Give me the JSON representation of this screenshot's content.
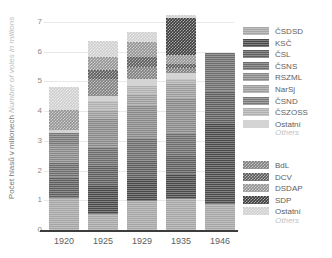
{
  "chart_data": {
    "type": "bar",
    "stacked": true,
    "title": "",
    "xlabel": "",
    "ylabel": "Počet hlasů v milionech",
    "ylabel_en": "Number of votes in millions",
    "ylim": [
      0,
      7
    ],
    "yticks": [
      0,
      1,
      2,
      3,
      4,
      5,
      6,
      7
    ],
    "grid": true,
    "legend_position": "right",
    "categories": [
      "1920",
      "1925",
      "1929",
      "1935",
      "1946"
    ],
    "series": [
      {
        "name": "ČSDSD",
        "values": [
          1.07,
          0.55,
          0.96,
          1.03,
          0.86
        ]
      },
      {
        "name": "KSČ",
        "values": [
          0.0,
          0.93,
          0.75,
          0.85,
          2.7
        ]
      },
      {
        "name": "ČSL",
        "values": [
          0.7,
          0.69,
          0.62,
          0.62,
          1.11
        ]
      },
      {
        "name": "ČSNS",
        "values": [
          0.5,
          0.61,
          0.77,
          0.76,
          1.3
        ]
      },
      {
        "name": "RSZML",
        "values": [
          0.6,
          0.97,
          1.11,
          1.18,
          0.0
        ]
      },
      {
        "name": "NarSj",
        "values": [
          0.0,
          0.29,
          0.36,
          0.46,
          0.0
        ]
      },
      {
        "name": "ČSND",
        "values": [
          0.39,
          0.0,
          0.0,
          0.0,
          0.0
        ]
      },
      {
        "name": "ČSZOSS",
        "values": [
          0.0,
          0.29,
          0.29,
          0.17,
          0.0
        ]
      },
      {
        "name": "Ostatní",
        "values": [
          0.1,
          0.18,
          0.22,
          0.23,
          0.0
        ]
      },
      {
        "name": "BdL",
        "values": [
          0.0,
          0.57,
          0.4,
          0.14,
          0.0
        ]
      },
      {
        "name": "DCV",
        "values": [
          0.0,
          0.32,
          0.35,
          0.16,
          0.0
        ]
      },
      {
        "name": "DSDAP",
        "values": [
          0.69,
          0.41,
          0.51,
          0.3,
          0.0
        ]
      },
      {
        "name": "SDP",
        "values": [
          0.0,
          0.0,
          0.0,
          1.25,
          0.0
        ]
      },
      {
        "name": "Ostatní2",
        "values": [
          0.75,
          0.56,
          0.31,
          0.09,
          0.0
        ]
      }
    ],
    "totals": [
      4.8,
      5.37,
      5.65,
      7.24,
      5.97
    ]
  },
  "axis": {
    "y_label_cz": "Počet hlasů v milionech",
    "y_label_en": "Number of votes in millions",
    "y_ticks": [
      "0",
      "1",
      "2",
      "3",
      "4",
      "5",
      "6",
      "7"
    ],
    "x_ticks": [
      "1920",
      "1925",
      "1929",
      "1935",
      "1946"
    ]
  },
  "legend": {
    "group1": [
      {
        "label": "ČSDSD",
        "color": "#a5a5a5",
        "pattern": "hlines"
      },
      {
        "label": "KSČ",
        "color": "#4a4a4a",
        "pattern": "hlines"
      },
      {
        "label": "ČSL",
        "color": "#5e5e5e",
        "pattern": "hlines"
      },
      {
        "label": "ČSNS",
        "color": "#6d6d6d",
        "pattern": "hlines"
      },
      {
        "label": "RSZML",
        "color": "#888888",
        "pattern": "hlines"
      },
      {
        "label": "NarSj",
        "color": "#9c9c9c",
        "pattern": "hlines"
      },
      {
        "label": "ČSND",
        "color": "#787878",
        "pattern": "hlines"
      },
      {
        "label": "ČSZOSS",
        "color": "#b0b0b0",
        "pattern": "hlines"
      },
      {
        "label": "Ostatní",
        "color": "#d4d4d4",
        "pattern": "solid"
      }
    ],
    "group1_sub": "Others",
    "group2": [
      {
        "label": "BdL",
        "color": "#7e7e7e",
        "pattern": "checker"
      },
      {
        "label": "DCV",
        "color": "#5a5a5a",
        "pattern": "checker"
      },
      {
        "label": "DSDAP",
        "color": "#949494",
        "pattern": "checker"
      },
      {
        "label": "SDP",
        "color": "#3b3b3b",
        "pattern": "checker"
      },
      {
        "label": "Ostatní",
        "color": "#cfcfcf",
        "pattern": "checker"
      }
    ],
    "group2_sub": "Others"
  }
}
